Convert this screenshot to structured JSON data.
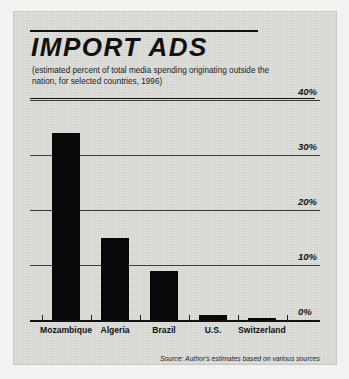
{
  "figure": {
    "title": "IMPORT ADS",
    "subtitle": "(estimated percent of total media spending originating outside the nation, for selected countries, 1996)",
    "source": "Source: Author's estimates based on various sources"
  },
  "chart_data": {
    "type": "bar",
    "title": "IMPORT ADS",
    "subtitle": "(estimated percent of total media spending originating outside the nation, for selected countries, 1996)",
    "categories": [
      "Mozambique",
      "Algeria",
      "Brazil",
      "U.S.",
      "Switzerland"
    ],
    "values": [
      34,
      15,
      9,
      1,
      0.4
    ],
    "xlabel": "",
    "ylabel": "",
    "ylim": [
      0,
      40
    ],
    "yticks": [
      0,
      10,
      20,
      30,
      40
    ],
    "ytick_labels": [
      "0%",
      "10%",
      "20%",
      "30%",
      "40%"
    ],
    "grid": true,
    "legend": "none",
    "bar_color": "#080808",
    "background_color": "#dededa",
    "note": "Source: Author's estimates based on various sources"
  }
}
